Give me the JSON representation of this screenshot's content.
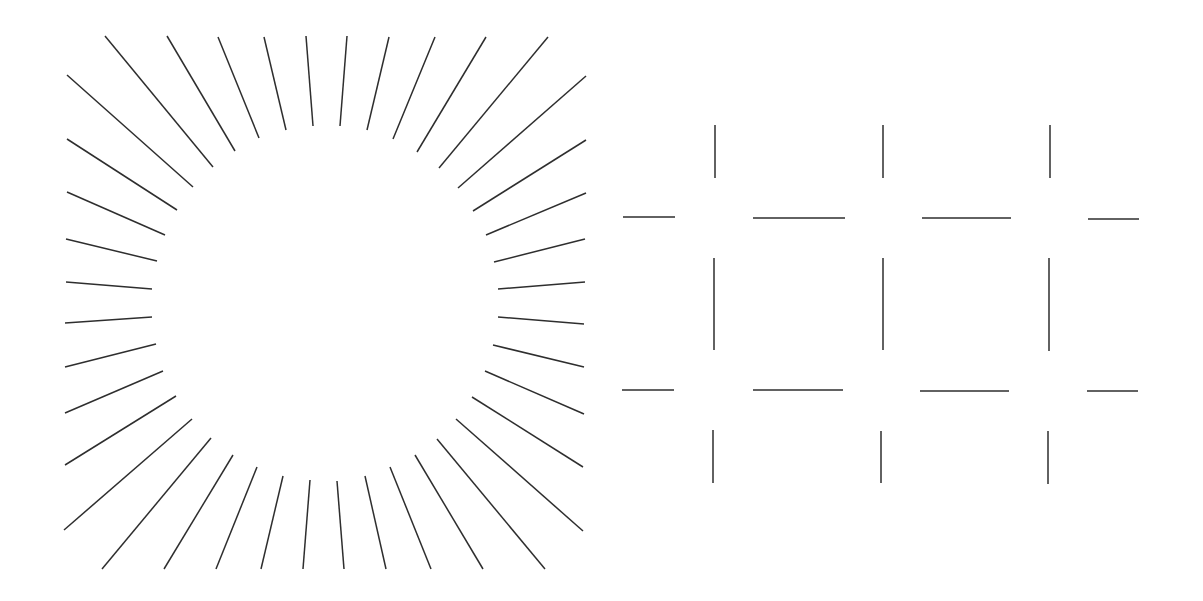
{
  "canvas": {
    "width": 1203,
    "height": 601,
    "background": "#ffffff"
  },
  "style": {
    "stroke": "#2e2e2e",
    "stroke_width": 1.5
  },
  "figures": [
    {
      "name": "illusory-circle",
      "description": "Radial line segments whose inner ends form an illusory circle",
      "lines": [
        [
          105,
          36,
          213,
          167
        ],
        [
          167,
          36,
          235,
          151
        ],
        [
          218,
          37,
          259,
          138
        ],
        [
          264,
          37,
          286,
          130
        ],
        [
          306,
          36,
          313,
          126
        ],
        [
          347,
          36,
          340,
          126
        ],
        [
          389,
          37,
          367,
          130
        ],
        [
          435,
          37,
          393,
          139
        ],
        [
          486,
          37,
          417,
          152
        ],
        [
          548,
          37,
          439,
          168
        ],
        [
          586,
          76,
          458,
          188
        ],
        [
          586,
          140,
          473,
          211
        ],
        [
          586,
          193,
          486,
          235
        ],
        [
          585,
          239,
          494,
          262
        ],
        [
          585,
          282,
          498,
          289
        ],
        [
          584,
          324,
          498,
          317
        ],
        [
          584,
          367,
          493,
          345
        ],
        [
          584,
          414,
          485,
          371
        ],
        [
          583,
          467,
          472,
          397
        ],
        [
          583,
          531,
          456,
          419
        ],
        [
          545,
          569,
          437,
          439
        ],
        [
          483,
          569,
          415,
          455
        ],
        [
          431,
          569,
          390,
          467
        ],
        [
          386,
          569,
          365,
          476
        ],
        [
          344,
          569,
          337,
          481
        ],
        [
          303,
          569,
          310,
          480
        ],
        [
          261,
          569,
          283,
          476
        ],
        [
          216,
          569,
          257,
          467
        ],
        [
          164,
          569,
          233,
          455
        ],
        [
          102,
          569,
          211,
          438
        ],
        [
          64,
          530,
          192,
          419
        ],
        [
          65,
          465,
          176,
          396
        ],
        [
          65,
          413,
          163,
          371
        ],
        [
          65,
          367,
          156,
          344
        ],
        [
          65,
          323,
          152,
          317
        ],
        [
          66,
          282,
          152,
          289
        ],
        [
          66,
          239,
          157,
          261
        ],
        [
          67,
          192,
          165,
          235
        ],
        [
          67,
          139,
          177,
          210
        ],
        [
          67,
          75,
          193,
          187
        ]
      ]
    },
    {
      "name": "illusory-grid",
      "description": "Grid of line segments with gaps at intersections forming illusory squares",
      "lines": [
        [
          715,
          125,
          715,
          178
        ],
        [
          883,
          125,
          883,
          178
        ],
        [
          1050,
          125,
          1050,
          178
        ],
        [
          623,
          217,
          675,
          217
        ],
        [
          753,
          218,
          845,
          218
        ],
        [
          922,
          218,
          1011,
          218
        ],
        [
          1088,
          219,
          1139,
          219
        ],
        [
          714,
          258,
          714,
          350
        ],
        [
          883,
          258,
          883,
          350
        ],
        [
          1049,
          258,
          1049,
          351
        ],
        [
          622,
          390,
          674,
          390
        ],
        [
          753,
          390,
          843,
          390
        ],
        [
          920,
          391,
          1009,
          391
        ],
        [
          1087,
          391,
          1138,
          391
        ],
        [
          713,
          430,
          713,
          483
        ],
        [
          881,
          431,
          881,
          483
        ],
        [
          1048,
          431,
          1048,
          484
        ]
      ]
    }
  ]
}
